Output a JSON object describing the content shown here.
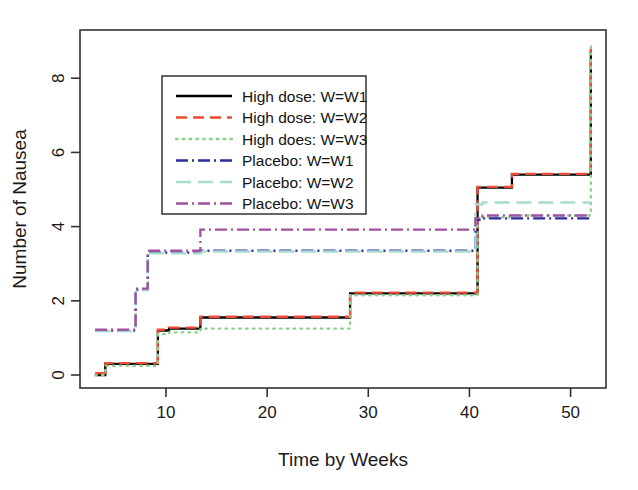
{
  "chart_data": {
    "type": "line",
    "subtype": "step-function",
    "title": "",
    "xlabel": "Time by Weeks",
    "ylabel": "Number of Nausea",
    "xlim": [
      1.5,
      53.5
    ],
    "ylim": [
      -0.35,
      9.3
    ],
    "xticks": [
      10,
      20,
      30,
      40,
      50
    ],
    "yticks": [
      0,
      2,
      4,
      6,
      8
    ],
    "xtick_labels": [
      "10",
      "20",
      "30",
      "40",
      "50"
    ],
    "ytick_labels": [
      "0",
      "2",
      "4",
      "6",
      "8"
    ],
    "grid": false,
    "legend_position": "upper-left-inside",
    "series": [
      {
        "name": "High dose: W=W1",
        "color": "#000000",
        "dash": "solid",
        "x": [
          3.0,
          4.0,
          4.0,
          9.2,
          9.2,
          10.3,
          10.3,
          13.4,
          13.4,
          28.2,
          28.2,
          40.8,
          40.8,
          44.2,
          44.2,
          52.0,
          52.0
        ],
        "y": [
          0.0,
          0.0,
          0.3,
          0.3,
          1.2,
          1.2,
          1.25,
          1.25,
          1.55,
          1.55,
          2.2,
          2.2,
          5.05,
          5.05,
          5.4,
          5.4,
          8.75
        ]
      },
      {
        "name": "High dose: W=W2",
        "color": "#F04A32",
        "dash": "dashed",
        "x": [
          3.0,
          4.0,
          4.0,
          9.2,
          9.2,
          10.3,
          10.3,
          13.4,
          13.4,
          28.2,
          28.2,
          40.8,
          40.8,
          44.2,
          44.2,
          52.0,
          52.0
        ],
        "y": [
          0.05,
          0.05,
          0.32,
          0.32,
          1.22,
          1.22,
          1.28,
          1.28,
          1.57,
          1.57,
          2.22,
          2.22,
          5.07,
          5.07,
          5.42,
          5.42,
          8.8
        ]
      },
      {
        "name": "High does: W=W3",
        "color": "#8BD18B",
        "dash": "dotted",
        "x": [
          3.0,
          4.0,
          4.0,
          9.2,
          9.2,
          10.3,
          10.3,
          13.4,
          13.4,
          28.2,
          28.2,
          40.8,
          40.8,
          44.2,
          44.2,
          52.0,
          52.0
        ],
        "y": [
          0.0,
          0.0,
          0.25,
          0.25,
          1.1,
          1.1,
          1.15,
          1.15,
          1.25,
          1.25,
          2.15,
          2.15,
          4.25,
          4.25,
          4.3,
          4.3,
          8.95
        ]
      },
      {
        "name": "Placebo: W=W1",
        "color": "#2B2B9E",
        "dash": "dashdot",
        "x": [
          3.0,
          7.0,
          7.0,
          8.2,
          8.2,
          13.4,
          13.4,
          40.6,
          40.6,
          41.3,
          41.3,
          52.0
        ],
        "y": [
          1.2,
          1.2,
          2.3,
          2.3,
          3.3,
          3.3,
          3.35,
          3.35,
          4.18,
          4.18,
          4.22,
          4.22
        ]
      },
      {
        "name": "Placebo: W=W2",
        "color": "#A8DCD0",
        "dash": "longdash",
        "x": [
          3.0,
          7.0,
          7.0,
          8.2,
          8.2,
          13.4,
          13.4,
          40.6,
          40.6,
          41.3,
          41.3,
          52.0
        ],
        "y": [
          1.18,
          1.18,
          2.28,
          2.28,
          3.28,
          3.28,
          3.33,
          3.33,
          4.6,
          4.6,
          4.65,
          4.65
        ]
      },
      {
        "name": "Placebo: W=W3",
        "color": "#A0529E",
        "dash": "dashdot",
        "x": [
          3.0,
          7.0,
          7.0,
          8.2,
          8.2,
          13.4,
          13.4,
          40.6,
          40.6,
          41.3,
          41.3,
          52.0
        ],
        "y": [
          1.22,
          1.22,
          2.33,
          2.33,
          3.35,
          3.35,
          3.92,
          3.92,
          4.22,
          4.22,
          4.3,
          4.3
        ]
      }
    ]
  },
  "legend": {
    "items": [
      {
        "label": "High dose: W=W1"
      },
      {
        "label": "High dose: W=W2"
      },
      {
        "label": "High does: W=W3"
      },
      {
        "label": "Placebo: W=W1"
      },
      {
        "label": "Placebo: W=W2"
      },
      {
        "label": "Placebo: W=W3"
      }
    ]
  }
}
